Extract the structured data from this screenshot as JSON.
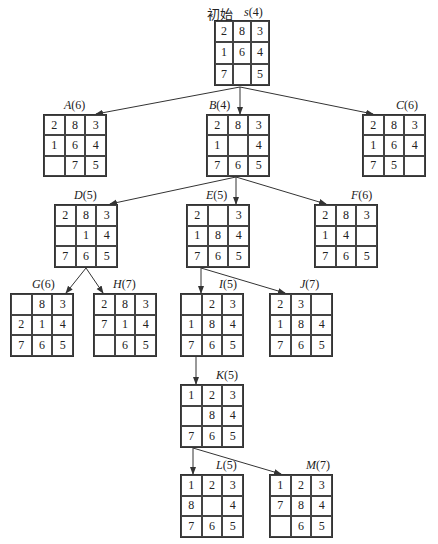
{
  "diagram": {
    "type": "8-puzzle search tree",
    "root_caption": "初始",
    "nodes": [
      {
        "id": "s",
        "label": "s",
        "h": "(4)",
        "x": 214,
        "y": 20,
        "w": 56,
        "h_px": 66,
        "label_x": 244,
        "label_y": 5,
        "cells": [
          "2",
          "8",
          "3",
          "1",
          "6",
          "4",
          "7",
          "",
          "5"
        ]
      },
      {
        "id": "A",
        "label": "A",
        "h": "(6)",
        "x": 43,
        "y": 114,
        "w": 64,
        "h_px": 63,
        "label_x": 64,
        "label_y": 98,
        "cells": [
          "2",
          "8",
          "3",
          "1",
          "6",
          "4",
          "",
          "7",
          "5"
        ]
      },
      {
        "id": "B",
        "label": "B",
        "h": "(4)",
        "x": 206,
        "y": 114,
        "w": 64,
        "h_px": 63,
        "label_x": 209,
        "label_y": 98,
        "cells": [
          "2",
          "8",
          "3",
          "1",
          "",
          "4",
          "7",
          "6",
          "5"
        ]
      },
      {
        "id": "C",
        "label": "C",
        "h": "(6)",
        "x": 362,
        "y": 114,
        "w": 64,
        "h_px": 63,
        "label_x": 396,
        "label_y": 98,
        "cells": [
          "2",
          "8",
          "3",
          "1",
          "6",
          "4",
          "7",
          "5",
          ""
        ]
      },
      {
        "id": "D",
        "label": "D",
        "h": "(5)",
        "x": 54,
        "y": 204,
        "w": 64,
        "h_px": 64,
        "label_x": 74,
        "label_y": 188,
        "cells": [
          "2",
          "8",
          "3",
          "",
          "1",
          "4",
          "7",
          "6",
          "5"
        ]
      },
      {
        "id": "E",
        "label": "E",
        "h": "(5)",
        "x": 186,
        "y": 204,
        "w": 64,
        "h_px": 64,
        "label_x": 206,
        "label_y": 188,
        "cells": [
          "2",
          "",
          "3",
          "1",
          "8",
          "4",
          "7",
          "6",
          "5"
        ]
      },
      {
        "id": "F",
        "label": "F",
        "h": "(6)",
        "x": 314,
        "y": 204,
        "w": 64,
        "h_px": 64,
        "label_x": 351,
        "label_y": 188,
        "cells": [
          "2",
          "8",
          "3",
          "1",
          "4",
          "",
          "7",
          "6",
          "5"
        ]
      },
      {
        "id": "G",
        "label": "G",
        "h": "(6)",
        "x": 10,
        "y": 293,
        "w": 64,
        "h_px": 64,
        "label_x": 32,
        "label_y": 277,
        "cells": [
          "",
          "8",
          "3",
          "2",
          "1",
          "4",
          "7",
          "6",
          "5"
        ]
      },
      {
        "id": "H",
        "label": "H",
        "h": "(7)",
        "x": 93,
        "y": 293,
        "w": 64,
        "h_px": 64,
        "label_x": 113,
        "label_y": 277,
        "cells": [
          "2",
          "8",
          "3",
          "7",
          "1",
          "4",
          "",
          "6",
          "5"
        ]
      },
      {
        "id": "I",
        "label": "I",
        "h": "(5)",
        "x": 180,
        "y": 293,
        "w": 64,
        "h_px": 64,
        "label_x": 219,
        "label_y": 277,
        "cells": [
          "",
          "2",
          "3",
          "1",
          "8",
          "4",
          "7",
          "6",
          "5"
        ]
      },
      {
        "id": "J",
        "label": "J",
        "h": "(7)",
        "x": 269,
        "y": 293,
        "w": 64,
        "h_px": 64,
        "label_x": 300,
        "label_y": 277,
        "cells": [
          "2",
          "3",
          "",
          "1",
          "8",
          "4",
          "7",
          "6",
          "5"
        ]
      },
      {
        "id": "K",
        "label": "K",
        "h": "(5)",
        "x": 180,
        "y": 384,
        "w": 64,
        "h_px": 64,
        "label_x": 216,
        "label_y": 368,
        "cells": [
          "1",
          "2",
          "3",
          "",
          "8",
          "4",
          "7",
          "6",
          "5"
        ]
      },
      {
        "id": "L",
        "label": "L",
        "h": "(5)",
        "x": 180,
        "y": 474,
        "w": 64,
        "h_px": 64,
        "label_x": 216,
        "label_y": 458,
        "cells": [
          "1",
          "2",
          "3",
          "8",
          "",
          "4",
          "7",
          "6",
          "5"
        ]
      },
      {
        "id": "M",
        "label": "M",
        "h": "(7)",
        "x": 269,
        "y": 474,
        "w": 64,
        "h_px": 64,
        "label_x": 306,
        "label_y": 458,
        "cells": [
          "1",
          "2",
          "3",
          "7",
          "8",
          "4",
          "",
          "6",
          "5"
        ]
      }
    ],
    "edges": [
      {
        "from": "s",
        "to": "A",
        "x1": 240,
        "y1": 87,
        "x2": 96,
        "y2": 114
      },
      {
        "from": "s",
        "to": "B",
        "x1": 240,
        "y1": 87,
        "x2": 240,
        "y2": 114
      },
      {
        "from": "s",
        "to": "C",
        "x1": 240,
        "y1": 87,
        "x2": 373,
        "y2": 114
      },
      {
        "from": "B",
        "to": "D",
        "x1": 236,
        "y1": 177,
        "x2": 110,
        "y2": 204
      },
      {
        "from": "B",
        "to": "E",
        "x1": 236,
        "y1": 177,
        "x2": 236,
        "y2": 204
      },
      {
        "from": "B",
        "to": "F",
        "x1": 236,
        "y1": 177,
        "x2": 326,
        "y2": 204
      },
      {
        "from": "D",
        "to": "G",
        "x1": 86,
        "y1": 268,
        "x2": 66,
        "y2": 293
      },
      {
        "from": "D",
        "to": "H",
        "x1": 86,
        "y1": 268,
        "x2": 103,
        "y2": 293
      },
      {
        "from": "E",
        "to": "I",
        "x1": 201,
        "y1": 268,
        "x2": 201,
        "y2": 293
      },
      {
        "from": "E",
        "to": "J",
        "x1": 201,
        "y1": 268,
        "x2": 285,
        "y2": 293
      },
      {
        "from": "I",
        "to": "K",
        "x1": 196,
        "y1": 357,
        "x2": 196,
        "y2": 384
      },
      {
        "from": "K",
        "to": "L",
        "x1": 193,
        "y1": 448,
        "x2": 193,
        "y2": 474
      },
      {
        "from": "K",
        "to": "M",
        "x1": 193,
        "y1": 448,
        "x2": 281,
        "y2": 474
      }
    ],
    "colors": {
      "line": "#333333",
      "text": "#222222",
      "background": "#ffffff"
    }
  }
}
